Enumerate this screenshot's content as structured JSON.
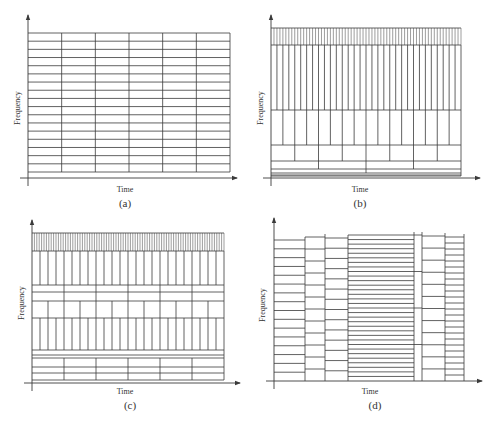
{
  "figure": {
    "axis_labels": {
      "x": "Time",
      "y": "Frequency"
    },
    "line_color": "#3a3a3a",
    "panels": [
      {
        "id": "a",
        "caption": "(a)",
        "description": "uniform time-frequency tiling (STFT)",
        "axis": {
          "x0": 28,
          "y0": 178,
          "x1": 237,
          "ytop": 15
        },
        "area": {
          "left": 28,
          "right": 230,
          "top": 33,
          "bottom": 172
        },
        "label_pos": {
          "time_x": 125,
          "time_y": 192,
          "cap_x": 125,
          "cap_y": 207,
          "freq_x": 20,
          "freq_y": 108
        },
        "bands": [
          {
            "top": 33,
            "bottom": 172,
            "rows": 17,
            "cols": 6
          }
        ]
      },
      {
        "id": "b",
        "caption": "(b)",
        "description": "dyadic wavelet tiling",
        "axis": {
          "x0": 271,
          "y0": 178,
          "x1": 480,
          "ytop": 15
        },
        "area": {
          "left": 271,
          "right": 461,
          "top": 28,
          "bottom": 176
        },
        "label_pos": {
          "time_x": 360,
          "time_y": 192,
          "cap_x": 360,
          "cap_y": 207,
          "freq_x": 263,
          "freq_y": 108
        },
        "bands": [
          {
            "top": 28,
            "bottom": 45,
            "rows": 1,
            "cols": 64
          },
          {
            "top": 45,
            "bottom": 110,
            "rows": 1,
            "cols": 32
          },
          {
            "top": 110,
            "bottom": 145,
            "rows": 1,
            "cols": 16
          },
          {
            "top": 145,
            "bottom": 161,
            "rows": 1,
            "cols": 8
          },
          {
            "top": 161,
            "bottom": 169,
            "rows": 1,
            "cols": 4
          },
          {
            "top": 169,
            "bottom": 173,
            "rows": 1,
            "cols": 2
          },
          {
            "top": 173,
            "bottom": 175,
            "rows": 1,
            "cols": 1
          },
          {
            "top": 175,
            "bottom": 176,
            "rows": 1,
            "cols": 1
          }
        ]
      },
      {
        "id": "c",
        "caption": "(c)",
        "description": "wavelet packet tiling",
        "axis": {
          "x0": 32,
          "y0": 383,
          "x1": 240,
          "ytop": 220
        },
        "area": {
          "left": 32,
          "right": 224,
          "top": 233,
          "bottom": 380
        },
        "label_pos": {
          "time_x": 125,
          "time_y": 394,
          "cap_x": 130,
          "cap_y": 409,
          "freq_x": 24,
          "freq_y": 303
        },
        "bands": [
          {
            "top": 233,
            "bottom": 251,
            "rows": 1,
            "cols": 80
          },
          {
            "top": 251,
            "bottom": 285,
            "rows": 1,
            "cols": 24
          },
          {
            "top": 285,
            "bottom": 292,
            "rows": 1,
            "cols": 6
          },
          {
            "top": 292,
            "bottom": 301,
            "rows": 1,
            "cols": 6
          },
          {
            "top": 301,
            "bottom": 318,
            "rows": 1,
            "cols": 12
          },
          {
            "top": 318,
            "bottom": 350,
            "rows": 1,
            "cols": 24
          },
          {
            "top": 350,
            "bottom": 355,
            "rows": 1,
            "cols": 1
          },
          {
            "top": 355,
            "bottom": 358,
            "rows": 1,
            "cols": 1
          },
          {
            "top": 358,
            "bottom": 367,
            "rows": 1,
            "cols": 6
          },
          {
            "top": 367,
            "bottom": 373,
            "rows": 1,
            "cols": 6
          },
          {
            "top": 373,
            "bottom": 380,
            "rows": 1,
            "cols": 6
          }
        ]
      },
      {
        "id": "d",
        "caption": "(d)",
        "description": "adaptive time segmentation tiling",
        "axis": {
          "x0": 274,
          "y0": 381,
          "x1": 482,
          "ytop": 218
        },
        "area": {
          "left": 274,
          "right": 464,
          "top": 235,
          "bottom": 381
        },
        "label_pos": {
          "time_x": 370,
          "time_y": 394,
          "cap_x": 375,
          "cap_y": 409,
          "freq_x": 265,
          "freq_y": 305
        },
        "columns": [
          {
            "left": 274,
            "right": 305,
            "top": 240,
            "rows": 16
          },
          {
            "left": 305,
            "right": 325,
            "top": 237,
            "rows": 12
          },
          {
            "left": 325,
            "right": 348,
            "top": 238,
            "rows": 14
          },
          {
            "left": 348,
            "right": 414,
            "top": 235,
            "rows": 32
          },
          {
            "left": 414,
            "right": 422,
            "top": 235,
            "rows": 4
          },
          {
            "left": 422,
            "right": 445,
            "top": 236,
            "rows": 12
          },
          {
            "left": 445,
            "right": 464,
            "top": 237,
            "rows": 24
          }
        ]
      }
    ]
  }
}
